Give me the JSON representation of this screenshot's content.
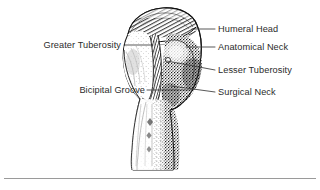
{
  "figure": {
    "background_color": "#ffffff",
    "ink_color": "#1a1a1a",
    "label_color": "#2b2b2b",
    "leader_color": "#3a3a3a",
    "rule_color": "#9a9a9a"
  },
  "labels": {
    "humeral_head": "Humeral Head",
    "anatomical_neck": "Anatomical Neck",
    "lesser_tuberosity": "Lesser Tuberosity",
    "surgical_neck": "Surgical Neck",
    "greater_tuberosity": "Greater Tuberosity",
    "bicipital_groove": "Bicipital Groove"
  },
  "annotations": [
    {
      "id": "humeral-head",
      "text": "Humeral Head",
      "side": "right",
      "leader": {
        "x1": 192,
        "y1": 29,
        "x2": 215,
        "y2": 29
      }
    },
    {
      "id": "anatomical-neck",
      "text": "Anatomical Neck",
      "side": "right",
      "leader": {
        "x1": 186,
        "y1": 47,
        "x2": 215,
        "y2": 47
      }
    },
    {
      "id": "lesser-tuberosity",
      "text": "Lesser Tuberosity",
      "side": "right",
      "leader": {
        "x1": 167,
        "y1": 61,
        "x2": 215,
        "y2": 70
      }
    },
    {
      "id": "surgical-neck",
      "text": "Surgical Neck",
      "side": "right",
      "leader": {
        "x1": 171,
        "y1": 86,
        "x2": 215,
        "y2": 92
      }
    },
    {
      "id": "greater-tuberosity",
      "text": "Greater Tuberosity",
      "side": "left",
      "leader": {
        "x1": 124,
        "y1": 45,
        "x2": 153,
        "y2": 45
      }
    },
    {
      "id": "bicipital-groove",
      "text": "Bicipital Groove",
      "side": "left",
      "leader": {
        "x1": 147,
        "y1": 90,
        "x2": 190,
        "y2": 90
      }
    }
  ],
  "caption_rule": {
    "present": true,
    "y": 178
  }
}
